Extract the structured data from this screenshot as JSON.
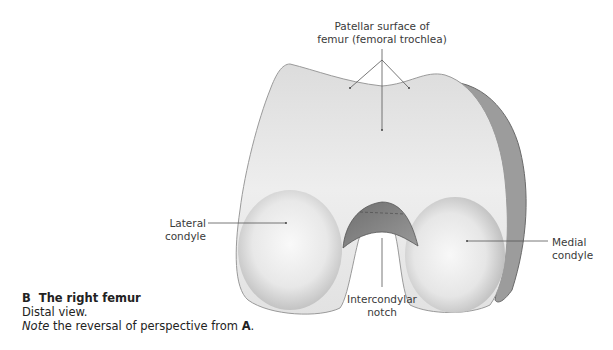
{
  "figure": {
    "view": "distal",
    "subject": "right femur"
  },
  "labels": {
    "patellar_surface": {
      "line1": "Patellar surface of",
      "line2": "femur (femoral trochlea)"
    },
    "lateral_condyle": {
      "line1": "Lateral",
      "line2": "condyle"
    },
    "medial_condyle": {
      "line1": "Medial",
      "line2": "condyle"
    },
    "intercondylar_notch": {
      "line1": "Intercondylar",
      "line2": "notch"
    }
  },
  "caption": {
    "letter": "B",
    "title": "The right femur",
    "subtitle": "Distal view.",
    "note_italic": "Note",
    "note_rest": " the reversal of perspective from ",
    "note_ref": "A",
    "note_end": "."
  },
  "colors": {
    "bone_light": "#f4f4f4",
    "bone_mid": "#d9d9d9",
    "bone_dark": "#8a8a8a",
    "leader_line": "#555555"
  }
}
